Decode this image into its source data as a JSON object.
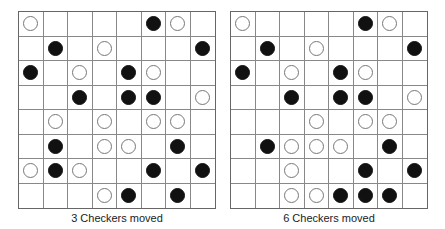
{
  "boards": [
    {
      "caption": "3 Checkers moved",
      "rows": [
        "W....BW.",
        ".B.W...B",
        "B.W.BW..",
        "..B.BB.W",
        ".W.W.WW.",
        ".B.WW.B.",
        "WBW..B.B",
        "...WB.B."
      ]
    },
    {
      "caption": "6 Checkers moved",
      "rows": [
        "W....BW.",
        ".B.W...B",
        "B.W.BW..",
        "..B.BB.W",
        "...W.WW.",
        ".BWWW.B.",
        "..W..B.B",
        "..WWBBB."
      ]
    }
  ],
  "legend": {
    "B": "black-checker",
    "W": "white-checker",
    ".": "empty"
  },
  "colors": {
    "black": "#111111",
    "white": "#ffffff",
    "grid": "#888888"
  }
}
